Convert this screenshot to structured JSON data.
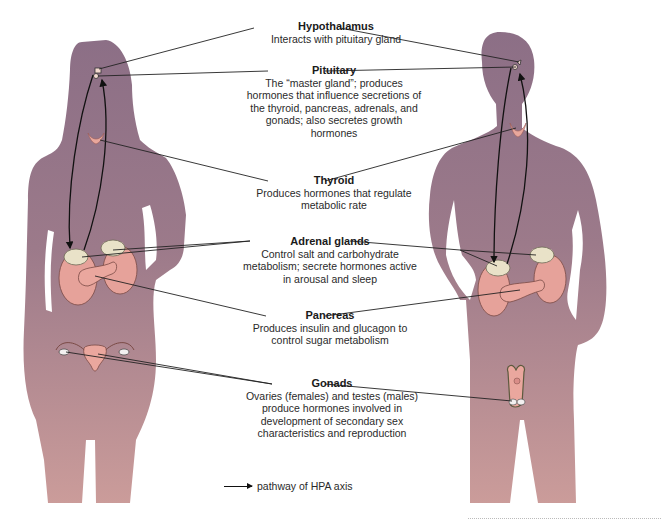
{
  "figure": {
    "colors": {
      "silhouette_top": "#8e7086",
      "silhouette_bottom": "#c99a9a",
      "organ_pink": "#e6a29a",
      "adrenal_cream": "#e9e2c8",
      "line": "#111111"
    }
  },
  "labels": [
    {
      "id": "hypothalamus",
      "title": "Hypothalamus",
      "description": "Interacts with pituitary gland"
    },
    {
      "id": "pituitary",
      "title": "Pituitary",
      "description": "The “master gland”; produces hormones that influence secretions of the thyroid, pancreas, adrenals, and gonads; also secretes growth hormones"
    },
    {
      "id": "thyroid",
      "title": "Thyroid",
      "description": "Produces hormones that regulate metabolic rate"
    },
    {
      "id": "adrenal",
      "title": "Adrenal glands",
      "description": "Control salt and carbohydrate metabolism; secrete hormones active in arousal and sleep"
    },
    {
      "id": "pancreas",
      "title": "Pancreas",
      "description": "Produces insulin and glucagon to control sugar metabolism"
    },
    {
      "id": "gonads",
      "title": "Gonads",
      "description": "Ovaries (females) and testes (males) produce hormones involved in development of secondary sex characteristics and reproduction"
    }
  ],
  "legend": {
    "icon": "arrow-right-icon",
    "label": "pathway of HPA axis"
  },
  "figures": {
    "female": {
      "label": "female-silhouette"
    },
    "male": {
      "label": "male-silhouette"
    }
  }
}
